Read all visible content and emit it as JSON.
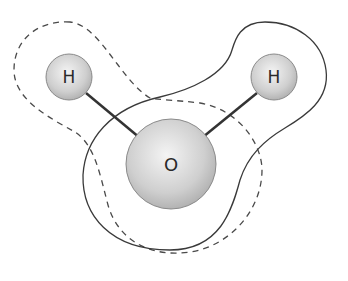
{
  "diagram": {
    "type": "molecule",
    "atoms": [
      {
        "id": "h-left",
        "label": "H",
        "cx": 69,
        "cy": 77,
        "r": 23
      },
      {
        "id": "h-right",
        "label": "H",
        "cx": 274,
        "cy": 77,
        "r": 23
      },
      {
        "id": "o",
        "label": "O",
        "cx": 171,
        "cy": 164,
        "r": 45
      }
    ],
    "bonds": [
      {
        "from": "h-left",
        "to": "o"
      },
      {
        "from": "h-right",
        "to": "o"
      }
    ],
    "contours": [
      {
        "id": "dashed-contour",
        "style": "dashed"
      },
      {
        "id": "solid-contour",
        "style": "solid"
      }
    ],
    "colors": {
      "atom_fill_light": "#f2f2f2",
      "atom_fill_dark": "#bdbdbd",
      "stroke": "#3a3a3a",
      "background": "#ffffff"
    }
  }
}
